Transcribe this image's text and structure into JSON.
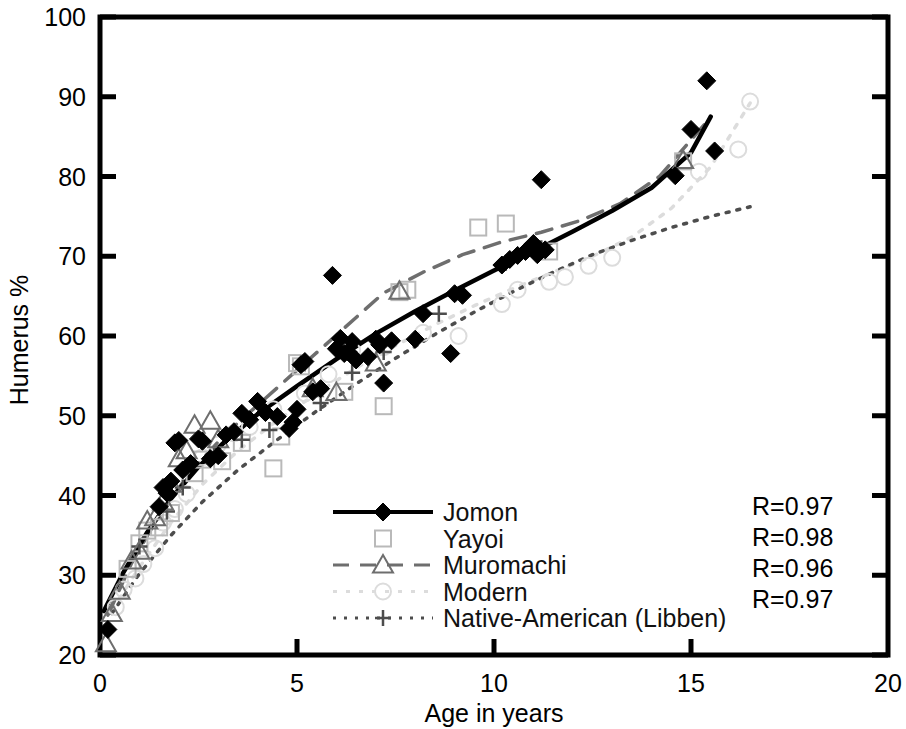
{
  "chart_data": {
    "type": "scatter",
    "title": "",
    "xlabel": "Age in years",
    "ylabel": "Humerus %",
    "xlim": [
      0,
      20
    ],
    "ylim": [
      20,
      100
    ],
    "xticks": [
      0,
      5,
      10,
      15,
      20
    ],
    "yticks": [
      20,
      30,
      40,
      50,
      60,
      70,
      80,
      90,
      100
    ],
    "grid": false,
    "legend_position": "lower-center",
    "series": [
      {
        "name": "Jomon",
        "marker": "filled-diamond",
        "line": "solid",
        "color": "#000000",
        "r_label": "R=0.97",
        "points": [
          [
            0.2,
            23.2
          ],
          [
            1.5,
            38.6
          ],
          [
            1.6,
            41.0
          ],
          [
            1.7,
            40.3
          ],
          [
            1.8,
            41.8
          ],
          [
            1.9,
            46.6
          ],
          [
            2.0,
            46.9
          ],
          [
            2.1,
            43.2
          ],
          [
            2.3,
            44.0
          ],
          [
            2.5,
            47.1
          ],
          [
            2.6,
            46.8
          ],
          [
            2.8,
            44.6
          ],
          [
            3.0,
            45.0
          ],
          [
            3.2,
            47.6
          ],
          [
            3.4,
            48.0
          ],
          [
            3.6,
            50.3
          ],
          [
            3.8,
            49.5
          ],
          [
            4.0,
            51.8
          ],
          [
            4.2,
            50.4
          ],
          [
            4.5,
            49.9
          ],
          [
            4.8,
            48.4
          ],
          [
            4.9,
            49.2
          ],
          [
            5.0,
            50.8
          ],
          [
            5.1,
            56.4
          ],
          [
            5.2,
            56.8
          ],
          [
            5.4,
            53.0
          ],
          [
            5.6,
            53.4
          ],
          [
            5.9,
            67.6
          ],
          [
            6.0,
            58.4
          ],
          [
            6.1,
            59.7
          ],
          [
            6.2,
            57.8
          ],
          [
            6.3,
            58.0
          ],
          [
            6.4,
            59.3
          ],
          [
            6.5,
            57.0
          ],
          [
            6.8,
            57.4
          ],
          [
            7.0,
            59.6
          ],
          [
            7.1,
            58.9
          ],
          [
            7.2,
            54.1
          ],
          [
            7.4,
            59.4
          ],
          [
            8.0,
            59.6
          ],
          [
            8.2,
            62.8
          ],
          [
            8.9,
            57.8
          ],
          [
            9.0,
            65.3
          ],
          [
            9.2,
            65.1
          ],
          [
            10.2,
            68.9
          ],
          [
            10.4,
            69.6
          ],
          [
            10.6,
            70.1
          ],
          [
            10.8,
            70.6
          ],
          [
            11.0,
            71.6
          ],
          [
            11.1,
            70.2
          ],
          [
            11.2,
            79.6
          ],
          [
            11.3,
            70.8
          ],
          [
            14.6,
            80.1
          ],
          [
            15.0,
            85.9
          ],
          [
            15.4,
            92.0
          ],
          [
            15.6,
            83.2
          ]
        ],
        "fit_curve": [
          [
            0.1,
            25.5
          ],
          [
            0.6,
            30.4
          ],
          [
            1.2,
            35.4
          ],
          [
            1.8,
            39.6
          ],
          [
            2.5,
            43.6
          ],
          [
            3.2,
            46.9
          ],
          [
            4.0,
            50.2
          ],
          [
            5.0,
            53.7
          ],
          [
            6.0,
            57.1
          ],
          [
            7.0,
            60.3
          ],
          [
            8.0,
            63.1
          ],
          [
            9.0,
            65.7
          ],
          [
            10.0,
            68.2
          ],
          [
            11.0,
            70.6
          ],
          [
            12.0,
            73.1
          ],
          [
            13.0,
            75.7
          ],
          [
            14.0,
            78.6
          ],
          [
            15.0,
            83.0
          ],
          [
            15.5,
            87.5
          ]
        ]
      },
      {
        "name": "Yayoi",
        "marker": "open-square",
        "line": "none",
        "color": "#b9b9b9",
        "r_label": "R=0.98",
        "points": [
          [
            0.7,
            30.8
          ],
          [
            1.0,
            34.0
          ],
          [
            1.2,
            35.6
          ],
          [
            1.5,
            36.0
          ],
          [
            1.8,
            37.8
          ],
          [
            2.4,
            42.8
          ],
          [
            2.6,
            44.5
          ],
          [
            3.1,
            44.3
          ],
          [
            3.6,
            46.6
          ],
          [
            4.4,
            43.4
          ],
          [
            4.6,
            47.4
          ],
          [
            5.0,
            56.6
          ],
          [
            5.1,
            56.2
          ],
          [
            6.2,
            53.0
          ],
          [
            7.2,
            51.2
          ],
          [
            7.6,
            65.5
          ],
          [
            7.8,
            65.8
          ],
          [
            9.6,
            73.6
          ],
          [
            10.3,
            74.1
          ],
          [
            11.4,
            70.6
          ],
          [
            14.8,
            81.9
          ]
        ],
        "fit_curve": []
      },
      {
        "name": "Muromachi",
        "marker": "open-triangle",
        "line": "dashed",
        "color": "#6e6e6e",
        "r_label": "R=0.96",
        "points": [
          [
            0.15,
            21.4
          ],
          [
            0.3,
            25.2
          ],
          [
            0.5,
            28.0
          ],
          [
            0.8,
            31.8
          ],
          [
            1.0,
            33.0
          ],
          [
            1.2,
            36.8
          ],
          [
            1.4,
            37.2
          ],
          [
            1.6,
            39.2
          ],
          [
            1.8,
            41.4
          ],
          [
            2.0,
            44.6
          ],
          [
            2.2,
            45.6
          ],
          [
            2.4,
            48.8
          ],
          [
            2.8,
            49.3
          ],
          [
            3.0,
            47.0
          ],
          [
            5.4,
            53.4
          ],
          [
            6.0,
            52.9
          ],
          [
            7.0,
            56.6
          ],
          [
            7.6,
            65.6
          ],
          [
            14.8,
            82.0
          ]
        ],
        "fit_curve": [
          [
            0.2,
            25.0
          ],
          [
            0.8,
            31.5
          ],
          [
            1.5,
            37.5
          ],
          [
            2.3,
            43.0
          ],
          [
            3.2,
            47.8
          ],
          [
            4.2,
            52.2
          ],
          [
            5.2,
            56.6
          ],
          [
            6.2,
            61.0
          ],
          [
            7.2,
            65.4
          ],
          [
            8.2,
            68.0
          ],
          [
            9.2,
            70.2
          ],
          [
            10.2,
            71.8
          ],
          [
            11.2,
            73.0
          ],
          [
            12.2,
            74.5
          ],
          [
            13.2,
            76.6
          ],
          [
            14.2,
            80.0
          ],
          [
            15.0,
            84.6
          ],
          [
            15.5,
            87.4
          ]
        ]
      },
      {
        "name": "Modern",
        "marker": "open-circle",
        "line": "dotted-faint",
        "color": "#dcdcdc",
        "r_label": "R=0.97",
        "points": [
          [
            0.4,
            26.0
          ],
          [
            0.6,
            28.2
          ],
          [
            0.9,
            29.6
          ],
          [
            1.1,
            31.4
          ],
          [
            1.4,
            33.4
          ],
          [
            1.6,
            36.6
          ],
          [
            1.9,
            38.3
          ],
          [
            2.2,
            40.2
          ],
          [
            2.6,
            44.8
          ],
          [
            3.0,
            46.4
          ],
          [
            3.4,
            47.8
          ],
          [
            3.8,
            48.6
          ],
          [
            4.4,
            50.8
          ],
          [
            5.2,
            52.8
          ],
          [
            5.8,
            55.2
          ],
          [
            6.4,
            58.2
          ],
          [
            7.2,
            58.6
          ],
          [
            8.2,
            60.4
          ],
          [
            9.1,
            60.0
          ],
          [
            10.2,
            64.0
          ],
          [
            10.6,
            65.8
          ],
          [
            11.4,
            66.8
          ],
          [
            11.8,
            67.4
          ],
          [
            12.4,
            68.8
          ],
          [
            13.0,
            69.8
          ],
          [
            15.2,
            80.6
          ],
          [
            16.2,
            83.4
          ],
          [
            16.5,
            89.4
          ]
        ],
        "fit_curve": [
          [
            0.3,
            25.6
          ],
          [
            1.0,
            31.0
          ],
          [
            1.8,
            36.6
          ],
          [
            2.6,
            41.4
          ],
          [
            3.5,
            45.6
          ],
          [
            4.5,
            49.4
          ],
          [
            5.5,
            52.8
          ],
          [
            6.5,
            56.0
          ],
          [
            7.5,
            58.8
          ],
          [
            8.5,
            61.4
          ],
          [
            9.5,
            63.8
          ],
          [
            10.5,
            66.0
          ],
          [
            11.5,
            68.0
          ],
          [
            12.5,
            70.0
          ],
          [
            13.5,
            72.4
          ],
          [
            14.5,
            76.0
          ],
          [
            15.5,
            81.2
          ],
          [
            16.5,
            89.2
          ]
        ]
      },
      {
        "name": "Native-American (Libben)",
        "marker": "plus",
        "line": "dotted",
        "color": "#4d4d4d",
        "r_label": "",
        "points": [
          [
            1.0,
            33.6
          ],
          [
            1.7,
            38.0
          ],
          [
            2.1,
            41.0
          ],
          [
            2.9,
            45.2
          ],
          [
            3.6,
            47.0
          ],
          [
            4.3,
            48.2
          ],
          [
            4.8,
            48.4
          ],
          [
            5.6,
            51.6
          ],
          [
            6.4,
            55.4
          ],
          [
            7.2,
            58.0
          ],
          [
            8.6,
            62.8
          ],
          [
            10.3,
            69.2
          ],
          [
            11.2,
            71.0
          ]
        ],
        "fit_curve": [
          [
            0.3,
            25.2
          ],
          [
            1.0,
            30.2
          ],
          [
            1.8,
            35.0
          ],
          [
            2.6,
            39.2
          ],
          [
            3.5,
            43.2
          ],
          [
            4.5,
            47.0
          ],
          [
            5.5,
            50.6
          ],
          [
            6.5,
            54.0
          ],
          [
            7.5,
            57.2
          ],
          [
            8.5,
            60.2
          ],
          [
            9.5,
            63.0
          ],
          [
            10.5,
            65.6
          ],
          [
            11.5,
            68.0
          ],
          [
            12.5,
            70.2
          ],
          [
            13.5,
            72.0
          ],
          [
            14.5,
            73.6
          ],
          [
            15.5,
            75.0
          ],
          [
            16.5,
            76.2
          ]
        ]
      }
    ],
    "r_values": [
      "R=0.97",
      "R=0.98",
      "R=0.96",
      "R=0.97"
    ]
  },
  "legend": {
    "entries": [
      {
        "label": "Jomon"
      },
      {
        "label": "Yayoi"
      },
      {
        "label": "Muromachi"
      },
      {
        "label": "Modern"
      },
      {
        "label": "Native-American (Libben)"
      }
    ]
  },
  "axes": {
    "x_title": "Age in years",
    "y_title": "Humerus %",
    "x_tick_labels": [
      "0",
      "5",
      "10",
      "15",
      "20"
    ],
    "y_tick_labels": [
      "20",
      "30",
      "40",
      "50",
      "60",
      "70",
      "80",
      "90",
      "100"
    ]
  },
  "stats": {
    "r_lines": [
      "R=0.97",
      "R=0.98",
      "R=0.96",
      "R=0.97"
    ]
  },
  "colors": {
    "axis": "#000000",
    "jomon": "#000000",
    "yayoi": "#b9b9b9",
    "muromachi": "#6e6e6e",
    "modern": "#dcdcdc",
    "libben": "#4d4d4d",
    "background": "#ffffff"
  }
}
